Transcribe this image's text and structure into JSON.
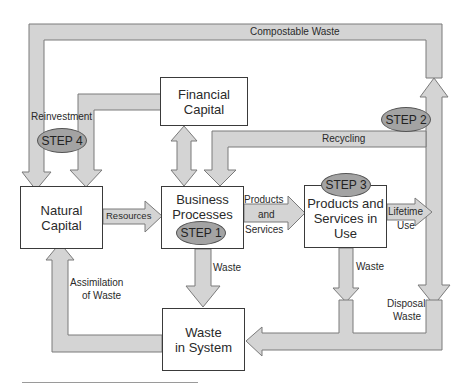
{
  "diagram": {
    "colors": {
      "arrow_fill": "#d4d4d4",
      "arrow_stroke": "#7a7a7a",
      "step_fill": "#a3a3a3",
      "box_border": "#3a3a3a"
    },
    "nodes": {
      "natural_capital": {
        "line1": "Natural",
        "line2": "Capital"
      },
      "financial_capital": {
        "line1": "Financial",
        "line2": "Capital"
      },
      "business_processes": {
        "line1": "Business",
        "line2": "Processes"
      },
      "products_services": {
        "line1": "Products and",
        "line2": "Services in",
        "line3": "Use"
      },
      "waste_system": {
        "line1": "Waste",
        "line2": "in System"
      }
    },
    "steps": {
      "step1": "STEP 1",
      "step2": "STEP 2",
      "step3": "STEP 3",
      "step4": "STEP 4"
    },
    "flows": {
      "compostable": "Compostable Waste",
      "reinvestment": "Reinvestment",
      "recycling": "Recycling",
      "resources": "Resources",
      "products_line1": "Products",
      "products_line2": "and",
      "products_line3": "Services",
      "lifetime_line1": "Lifetime",
      "lifetime_line2": "Use",
      "waste_bp": "Waste",
      "waste_ps": "Waste",
      "assimilation_line1": "Assimilation",
      "assimilation_line2": "of Waste",
      "disposal_line1": "Disposal",
      "disposal_line2": "Waste"
    }
  }
}
